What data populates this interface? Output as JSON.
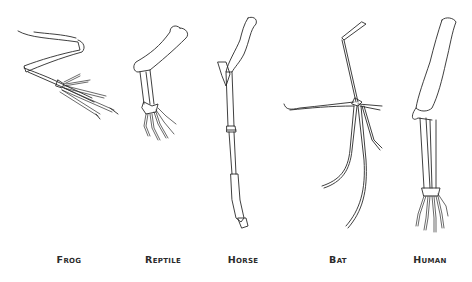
{
  "diagram": {
    "labels": [
      {
        "id": "frog",
        "text": "Frog",
        "x": 69
      },
      {
        "id": "reptile",
        "text": "Reptile",
        "x": 163
      },
      {
        "id": "horse",
        "text": "Horse",
        "x": 243
      },
      {
        "id": "bat",
        "text": "Bat",
        "x": 338
      },
      {
        "id": "human",
        "text": "Human",
        "x": 430
      }
    ],
    "colors": {
      "line": "#2a2a2a",
      "label": "#2b2b2b",
      "background": "#ffffff"
    }
  }
}
